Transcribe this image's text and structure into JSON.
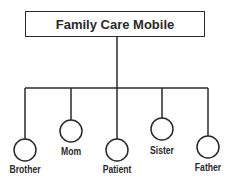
{
  "title": "Family Care Mobile",
  "nodes": [
    {
      "label": "Brother",
      "x": 25,
      "cy": 150,
      "ly": 163
    },
    {
      "label": "Mom",
      "x": 71,
      "cy": 131,
      "ly": 145
    },
    {
      "label": "Patient",
      "x": 117,
      "cy": 150,
      "ly": 163
    },
    {
      "label": "Sister",
      "x": 162,
      "cy": 129,
      "ly": 144
    },
    {
      "label": "Father",
      "x": 208,
      "cy": 147,
      "ly": 161
    }
  ],
  "colors": {
    "stroke": "#2a2a2a",
    "background": "#ffffff"
  }
}
